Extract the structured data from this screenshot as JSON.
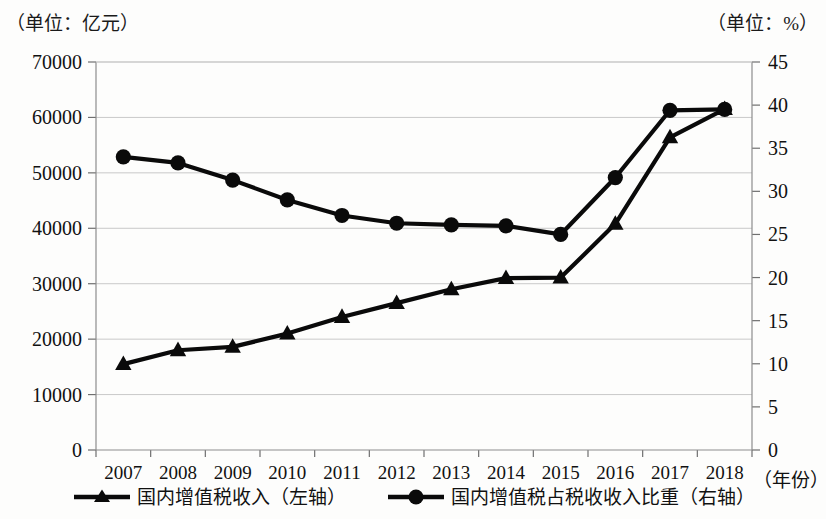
{
  "units": {
    "left": "（单位：亿元）",
    "right": "（单位：%）"
  },
  "axis": {
    "x_name": "（年份）",
    "left_ticks": [
      "0",
      "10000",
      "20000",
      "30000",
      "40000",
      "50000",
      "60000",
      "70000"
    ],
    "right_ticks": [
      "0",
      "5",
      "10",
      "15",
      "20",
      "25",
      "30",
      "35",
      "40",
      "45"
    ],
    "x_ticks": [
      "2007",
      "2008",
      "2009",
      "2010",
      "2011",
      "2012",
      "2013",
      "2014",
      "2015",
      "2016",
      "2017",
      "2018"
    ]
  },
  "legend": {
    "items": [
      {
        "label": "国内增值税收入（左轴）",
        "marker": "triangle-marker-icon"
      },
      {
        "label": "国内增值税占税收收入比重（右轴）",
        "marker": "circle-marker-icon"
      }
    ]
  },
  "chart_data": {
    "type": "line",
    "title": "",
    "subtitle": "",
    "xlabel": "（年份）",
    "ylabel": "（单位：亿元）",
    "y2label": "（单位：%）",
    "grid": true,
    "legend_position": "bottom",
    "x": [
      "2007",
      "2008",
      "2009",
      "2010",
      "2011",
      "2012",
      "2013",
      "2014",
      "2015",
      "2016",
      "2017",
      "2018"
    ],
    "ylim": [
      0,
      70000
    ],
    "y2lim": [
      0,
      45
    ],
    "yticks": [
      0,
      10000,
      20000,
      30000,
      40000,
      50000,
      60000,
      70000
    ],
    "y2ticks": [
      0,
      5,
      10,
      15,
      20,
      25,
      30,
      35,
      40,
      45
    ],
    "series": [
      {
        "name": "国内增值税收入（左轴）",
        "axis": "left",
        "unit": "亿元",
        "marker": "triangle",
        "color": "#0a0a0a",
        "values": [
          15500,
          18000,
          18600,
          21000,
          24000,
          26500,
          29000,
          31000,
          31100,
          40800,
          56400,
          61500
        ]
      },
      {
        "name": "国内增值税占税收收入比重（右轴）",
        "axis": "right",
        "unit": "%",
        "marker": "circle",
        "color": "#0a0a0a",
        "values": [
          34.0,
          33.3,
          31.3,
          29.0,
          27.2,
          26.3,
          26.1,
          26.0,
          25.0,
          31.6,
          39.4,
          39.5
        ]
      }
    ]
  }
}
